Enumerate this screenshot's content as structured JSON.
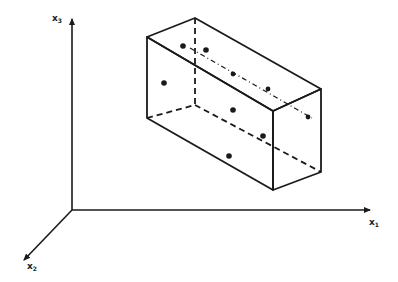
{
  "diagram": {
    "type": "3d-box-in-coordinate-system",
    "axes": [
      {
        "id": "x1",
        "label": "x",
        "subscript": "1"
      },
      {
        "id": "x2",
        "label": "x",
        "subscript": "2"
      },
      {
        "id": "x3",
        "label": "x",
        "subscript": "3"
      }
    ],
    "box": {
      "description": "Rectangular cuboid (hyperrectangle) drawn in perspective with hidden edges dashed",
      "point_count": 10
    },
    "colors": {
      "stroke": "#1a1a1a",
      "background": "#ffffff"
    }
  }
}
